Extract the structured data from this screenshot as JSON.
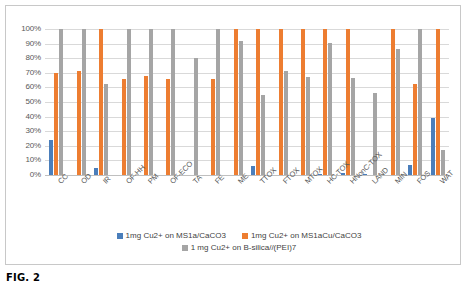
{
  "figure": {
    "caption": "FIG. 2"
  },
  "chart_data": {
    "type": "bar",
    "title": "",
    "xlabel": "",
    "ylabel": "",
    "ylim": [
      0,
      100
    ],
    "grid": true,
    "legend_position": "bottom",
    "y_ticks": [
      "0%",
      "10%",
      "20%",
      "30%",
      "40%",
      "50%",
      "60%",
      "70%",
      "80%",
      "90%",
      "100%"
    ],
    "y_tick_values": [
      0,
      10,
      20,
      30,
      40,
      50,
      60,
      70,
      80,
      90,
      100
    ],
    "categories": [
      "CC",
      "OD",
      "IR",
      "OF-HH",
      "PM",
      "OF-ECO",
      "TA",
      "FE",
      "ME",
      "TTOX",
      "FTOX",
      "MTOX",
      "HC-TOX",
      "HNonC-TOX",
      "LAND",
      "MIN",
      "FOS",
      "WAT"
    ],
    "series": [
      {
        "name": "1mg Cu2+ on MS1a/CaCO3",
        "color": "#4A7EBB",
        "values": [
          24,
          0,
          4.5,
          0,
          0,
          0,
          0,
          0,
          0,
          6,
          0,
          0,
          1,
          1.5,
          0.5,
          0,
          7,
          39
        ]
      },
      {
        "name": "1mg Cu2+ on MS1aCu/CaCO3",
        "color": "#ED7D31",
        "values": [
          70,
          71,
          100,
          65.5,
          67.5,
          65.5,
          0,
          66,
          100,
          100,
          100,
          100,
          100,
          100,
          0,
          100,
          62,
          100
        ]
      },
      {
        "name": "1 mg Cu2+ on B-silica//(PEI)7",
        "color": "#A5A5A5",
        "values": [
          100,
          100,
          62,
          100,
          100,
          100,
          80,
          100,
          92,
          55,
          71,
          67,
          90.5,
          66.5,
          56,
          86,
          100,
          17
        ]
      }
    ]
  }
}
